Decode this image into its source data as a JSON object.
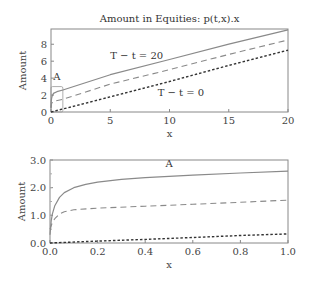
{
  "chart_data": [
    {
      "type": "line",
      "title": "Amount in Equities: p(t,x).x",
      "xlabel": "x",
      "ylabel": "Amount",
      "xlim": [
        0,
        20
      ],
      "ylim": [
        0,
        9.8
      ],
      "xticks": [
        0,
        5,
        10,
        15,
        20
      ],
      "yticks": [
        0,
        2,
        4,
        6,
        8
      ],
      "grid": false,
      "annotations": [
        {
          "text": "T − t = 20",
          "x": 5.0,
          "y": 6.2
        },
        {
          "text": "T − t = 0",
          "x": 9.0,
          "y": 1.9
        },
        {
          "text": "A",
          "x": 0.5,
          "y": 3.8
        }
      ],
      "inset_box": {
        "label": "A",
        "x": [
          0,
          1
        ],
        "y": [
          0,
          3
        ]
      },
      "series": [
        {
          "name": "T - t = 20",
          "style": "solid",
          "x": [
            0,
            0.02,
            0.05,
            0.1,
            0.2,
            0.5,
            1,
            5,
            10,
            15,
            20
          ],
          "y": [
            0.5,
            1.2,
            1.6,
            1.9,
            2.2,
            2.4,
            2.6,
            4.4,
            6.2,
            8.0,
            9.7
          ]
        },
        {
          "name": "T - t = 10",
          "style": "dashed",
          "x": [
            0,
            0.05,
            0.2,
            1,
            5,
            10,
            15,
            20
          ],
          "y": [
            0.5,
            1.0,
            1.25,
            1.5,
            3.3,
            5.0,
            6.8,
            8.5
          ]
        },
        {
          "name": "T - t = 0",
          "style": "dotted",
          "x": [
            0,
            1,
            5,
            10,
            15,
            20
          ],
          "y": [
            0.0,
            0.35,
            1.8,
            3.6,
            5.5,
            7.3
          ]
        }
      ]
    },
    {
      "type": "line",
      "title": "",
      "xlabel": "x",
      "ylabel": "Amount",
      "xlim": [
        0,
        1.0
      ],
      "ylim": [
        0,
        3.0
      ],
      "xticks": [
        0.0,
        0.2,
        0.4,
        0.6,
        0.8,
        1.0
      ],
      "yticks": [
        0.0,
        1.0,
        2.0,
        3.0
      ],
      "grid": false,
      "annotations": [
        {
          "text": "A",
          "x": 0.5,
          "y": 2.75
        }
      ],
      "series": [
        {
          "name": "T - t = 20",
          "style": "solid",
          "x": [
            0,
            0.005,
            0.01,
            0.02,
            0.04,
            0.06,
            0.1,
            0.15,
            0.2,
            0.3,
            0.4,
            0.6,
            0.8,
            1.0
          ],
          "y": [
            0.3,
            0.8,
            1.05,
            1.35,
            1.65,
            1.82,
            2.0,
            2.12,
            2.2,
            2.3,
            2.36,
            2.45,
            2.53,
            2.6
          ]
        },
        {
          "name": "T - t = 10",
          "style": "dashed",
          "x": [
            0,
            0.01,
            0.02,
            0.04,
            0.06,
            0.1,
            0.2,
            0.4,
            0.6,
            0.8,
            1.0
          ],
          "y": [
            0.5,
            0.75,
            0.88,
            1.05,
            1.13,
            1.2,
            1.26,
            1.33,
            1.4,
            1.47,
            1.55
          ]
        },
        {
          "name": "T - t = 0",
          "style": "dotted",
          "x": [
            0,
            0.2,
            0.4,
            0.6,
            0.8,
            1.0
          ],
          "y": [
            0.0,
            0.07,
            0.13,
            0.2,
            0.27,
            0.33
          ]
        }
      ]
    }
  ]
}
